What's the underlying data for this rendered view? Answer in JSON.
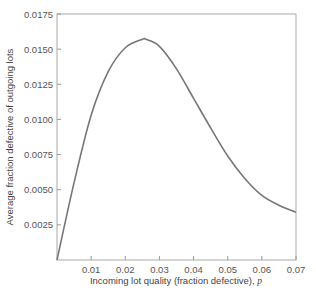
{
  "chart_data": {
    "type": "line",
    "title": "",
    "xlabel": "Incoming lot quality (fraction defective),",
    "xlabel_var": "p",
    "ylabel": "Average fraction defective of outgoing lots",
    "xlim": [
      0,
      0.07
    ],
    "ylim": [
      0,
      0.0175
    ],
    "x_ticks": [
      "0.01",
      "0.02",
      "0.03",
      "0.04",
      "0.05",
      "0.06",
      "0.07"
    ],
    "y_ticks": [
      "0.0025",
      "0.0050",
      "0.0075",
      "0.0100",
      "0.0125",
      "0.0150",
      "0.0175"
    ],
    "grid": false,
    "legend": null,
    "series": [
      {
        "name": "AOQ",
        "color": "#777777",
        "x": [
          0,
          0.005,
          0.01,
          0.015,
          0.02,
          0.025,
          0.026,
          0.03,
          0.035,
          0.04,
          0.045,
          0.05,
          0.055,
          0.06,
          0.065,
          0.07
        ],
        "y": [
          0,
          0.0055,
          0.0103,
          0.0134,
          0.0151,
          0.0157,
          0.0157,
          0.0152,
          0.0136,
          0.0115,
          0.0094,
          0.0074,
          0.0058,
          0.0046,
          0.0039,
          0.0034
        ]
      }
    ]
  }
}
